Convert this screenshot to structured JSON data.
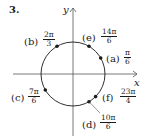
{
  "problem_number": "3.",
  "axes": {
    "x_label": "x",
    "y_label": "y"
  },
  "points": [
    {
      "letter": "(a)",
      "num": "π",
      "den": "6"
    },
    {
      "letter": "(b)",
      "num": "2π",
      "den": "3"
    },
    {
      "letter": "(c)",
      "num": "7π",
      "den": "6"
    },
    {
      "letter": "(d)",
      "num": "10π",
      "den": "6"
    },
    {
      "letter": "(e)",
      "num": "14π",
      "den": "6"
    },
    {
      "letter": "(f)",
      "num": "23π",
      "den": "4"
    }
  ],
  "colors": {
    "ink": "#1a1a1a",
    "axis": "#555555"
  }
}
